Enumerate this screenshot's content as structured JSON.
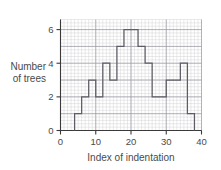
{
  "chart_data": {
    "type": "bar",
    "title": "",
    "subtitle": "",
    "xlabel": "Index of indentation",
    "ylabel": "Number of trees",
    "ylabel_line1": "Number",
    "ylabel_line2": "of trees",
    "xlim": [
      0,
      40
    ],
    "ylim": [
      0,
      6.6
    ],
    "xticks": [
      0,
      10,
      20,
      30,
      40
    ],
    "xticklabels": [
      "0",
      "10",
      "20",
      "30",
      "40"
    ],
    "yticks": [
      0,
      2,
      4,
      6
    ],
    "yticklabels": [
      "0",
      "2",
      "4",
      "6"
    ],
    "grid": true,
    "grid_minor_step_x": 1,
    "grid_minor_step_y": 0.2,
    "grid_major_step_x": 10,
    "grid_major_step_y": 1,
    "legend": null,
    "bin_width": 2,
    "bin_edges": [
      4,
      6,
      8,
      10,
      12,
      14,
      16,
      18,
      20,
      22,
      24,
      26,
      28,
      30,
      32,
      34,
      36,
      38
    ],
    "categories": [
      "4-6",
      "6-8",
      "8-10",
      "10-12",
      "12-14",
      "14-16",
      "16-18",
      "18-20",
      "20-22",
      "22-24",
      "24-26",
      "26-28",
      "28-30",
      "30-32",
      "32-34",
      "34-36",
      "36-38"
    ],
    "values": [
      1,
      2,
      3,
      2,
      4,
      3,
      5,
      6,
      6,
      5,
      4,
      2,
      2,
      3,
      3,
      4,
      1
    ],
    "outline_color": "#5d5d66",
    "grid_color": "#c9c9cf",
    "axis_color": "#3a3a3a"
  }
}
